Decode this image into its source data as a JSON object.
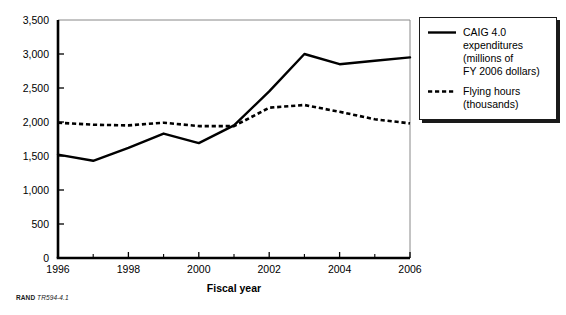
{
  "figure": {
    "source_caption_prefix": "RAND",
    "source_caption_id": "TR594-4.1"
  },
  "legend": {
    "position": "right",
    "items": [
      {
        "name": "caig-expenditures",
        "style": "solid",
        "label": "CAIG 4.0\nexpenditures\n(millions of\nFY 2006 dollars)"
      },
      {
        "name": "flying-hours",
        "style": "dashed",
        "label": "Flying hours\n(thousands)"
      }
    ]
  },
  "chart_data": {
    "type": "line",
    "title": "",
    "xlabel": "Fiscal year",
    "ylabel": "",
    "x": [
      1996,
      1997,
      1998,
      1999,
      2000,
      2001,
      2002,
      2003,
      2004,
      2005,
      2006
    ],
    "xlim": [
      1996,
      2006
    ],
    "ylim": [
      0,
      3500
    ],
    "xticks": [
      1996,
      1998,
      2000,
      2002,
      2004,
      2006
    ],
    "xtick_labels": [
      "1996",
      "1998",
      "2000",
      "2002",
      "2004",
      "2006"
    ],
    "xminorticks": [
      1997,
      1999,
      2001,
      2003,
      2005
    ],
    "yticks": [
      0,
      500,
      1000,
      1500,
      2000,
      2500,
      3000,
      3500
    ],
    "ytick_labels": [
      "0",
      "500",
      "1,000",
      "1,500",
      "2,000",
      "2,500",
      "3,000",
      "3,500"
    ],
    "grid": false,
    "series": [
      {
        "name": "CAIG 4.0 expenditures (millions of FY 2006 dollars)",
        "style": "solid",
        "color": "#000000",
        "values": [
          1520,
          1430,
          1620,
          1830,
          1690,
          1950,
          2450,
          3000,
          2850,
          2900,
          2950
        ]
      },
      {
        "name": "Flying hours (thousands)",
        "style": "dashed",
        "color": "#000000",
        "values": [
          1990,
          1960,
          1950,
          1990,
          1940,
          1940,
          2210,
          2250,
          2150,
          2040,
          1980
        ]
      }
    ]
  }
}
